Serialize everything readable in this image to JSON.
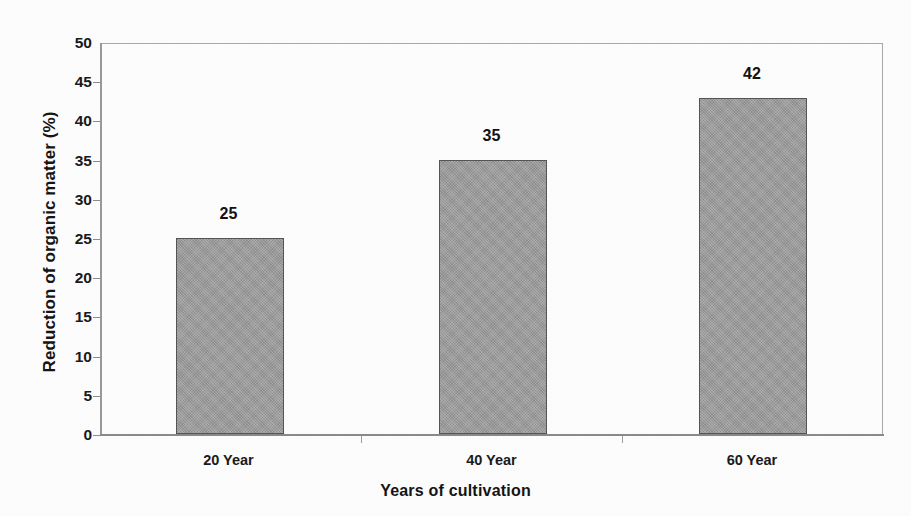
{
  "chart_data": {
    "type": "bar",
    "title": "",
    "categories": [
      "20 Year",
      "40 Year",
      "60 Year"
    ],
    "values": [
      25,
      35,
      42
    ],
    "bar_heights_plotted": [
      25,
      35,
      42.8
    ],
    "data_labels": [
      "25",
      "35",
      "42"
    ],
    "xlabel": "Years of cultivation",
    "ylabel": "Reduction of organic matter (%)",
    "ylim": [
      0,
      50
    ],
    "ytick_step": 5,
    "yticks": [
      0,
      5,
      10,
      15,
      20,
      25,
      30,
      35,
      40,
      45,
      50
    ],
    "ytick_labels": [
      "0",
      "5",
      "10",
      "15",
      "20",
      "25",
      "30",
      "35",
      "40",
      "45",
      "50"
    ],
    "grid": false,
    "legend": null,
    "legend_position": "none",
    "series": [
      {
        "name": "Reduction of organic matter",
        "values": [
          25,
          35,
          42
        ]
      }
    ],
    "colors": {
      "bar_fill": "#9c9c9c",
      "bar_border": "#555555",
      "axis": "#8a8a8a",
      "text": "#141414",
      "background": "#fdfdfd"
    }
  },
  "axis": {
    "y_title": "Reduction of organic matter (%)",
    "x_title": "Years of cultivation"
  }
}
